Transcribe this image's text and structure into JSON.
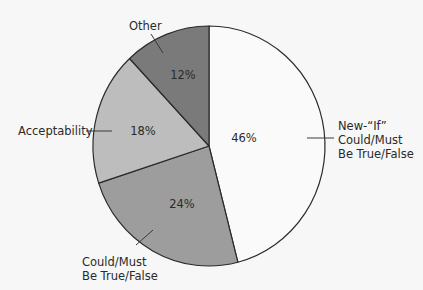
{
  "chart_data": {
    "type": "pie",
    "title": "",
    "start_angle_deg": 0,
    "direction": "clockwise",
    "slices": [
      {
        "label": "New-“If” Could/Must Be True/False",
        "label_lines": [
          "New-“If”",
          "Could/Must",
          "Be True/False"
        ],
        "value": 46,
        "display": "46%",
        "color": "#fafafa"
      },
      {
        "label": "Could/Must Be True/False",
        "label_lines": [
          "Could/Must",
          "Be True/False"
        ],
        "value": 24,
        "display": "24%",
        "color": "#9d9d9d"
      },
      {
        "label": "Acceptability",
        "label_lines": [
          "Acceptability"
        ],
        "value": 18,
        "display": "18%",
        "color": "#bdbdbd"
      },
      {
        "label": "Other",
        "label_lines": [
          "Other"
        ],
        "value": 12,
        "display": "12%",
        "color": "#7a7a7a"
      }
    ],
    "legend": "none (external callout labels with leader lines)",
    "stroke_color": "#2b2b2b",
    "background": "#f7f7f7"
  }
}
